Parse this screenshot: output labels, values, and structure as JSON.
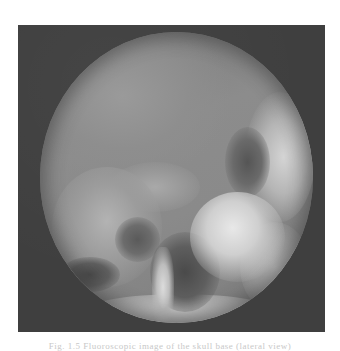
{
  "figure": {
    "type": "fluoroscopy-xray-image",
    "field_of_view": "circular",
    "frame_color": "#3f3f3f",
    "caption": "Fig. 1.5 Fluoroscopic image of the skull base (lateral view)"
  }
}
